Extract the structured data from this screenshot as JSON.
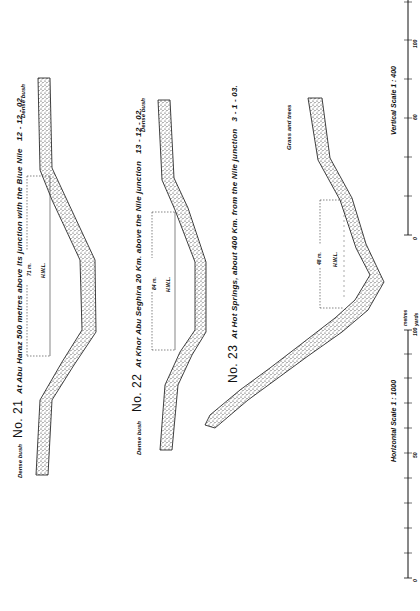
{
  "sections": [
    {
      "number": "No. 21",
      "title": "At Abu Haraz 500 metres above its junction with the Blue Nile",
      "date": "12 - 12 - 02.",
      "width_label": "71 m.",
      "water_level_label": "H.W.L.",
      "left_bank_label": "Dense bush",
      "right_bank_label": "Dense bush"
    },
    {
      "number": "No. 22",
      "title": "At Khor Abu Seghira 20 Km. above the Nile junction",
      "date": "13 - 12 - 02.",
      "width_label": "84 m.",
      "water_level_label": "H.W.L.",
      "left_bank_label": "Dense bush",
      "right_bank_label": "Dense bush"
    },
    {
      "number": "No. 23",
      "title": "At Hot Springs, about 400 Km. from the Nile junction",
      "date": "3 - 1 - 03.",
      "width_label": "48 m.",
      "water_level_label": "H.W.L.",
      "right_bank_label": "Grass and trees"
    }
  ],
  "scales": {
    "vertical": {
      "label": "Vertical Scale 1 : 400",
      "feet_ticks": [
        "0",
        "10",
        "20",
        "30",
        "40",
        "50",
        "60",
        "70",
        "80",
        "90",
        "100",
        "110",
        "120"
      ],
      "metre_ticks": [
        "0",
        "5",
        "10",
        "15",
        "20",
        "25",
        "30",
        "35"
      ]
    },
    "horizontal": {
      "label": "Horizontal Scale 1 : 1000",
      "metre_ticks": [
        "0",
        "10",
        "20",
        "30",
        "40",
        "50",
        "60",
        "70",
        "80",
        "90",
        "100"
      ],
      "yard_ticks": [
        "0",
        "10",
        "20",
        "30",
        "40",
        "50",
        "60",
        "70",
        "80",
        "90",
        "100"
      ],
      "metre_unit": "metres",
      "yard_unit": "yards"
    }
  }
}
